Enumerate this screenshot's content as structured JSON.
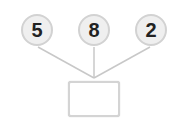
{
  "diagram": {
    "type": "number-bond",
    "parts": [
      {
        "value": "5"
      },
      {
        "value": "8"
      },
      {
        "value": "2"
      }
    ],
    "whole": {
      "value": ""
    },
    "colors": {
      "circle_fill": "#efefef",
      "circle_border": "#d2d2d2",
      "line": "#c8c8c8",
      "box_border": "#d4d4d4"
    }
  }
}
